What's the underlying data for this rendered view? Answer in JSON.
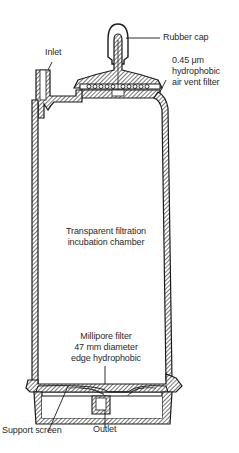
{
  "diagram": {
    "type": "cross-section",
    "line_color": "#1a1a1a",
    "background": "#ffffff",
    "labels": {
      "rubber_cap": "Rubber cap",
      "air_vent_filter": [
        "0.45 μm",
        "hydrophobic",
        "air vent filter"
      ],
      "inlet": "Inlet",
      "chamber": [
        "Transparent filtration",
        "incubation chamber"
      ],
      "millipore_filter": [
        "Millipore filter",
        "47 mm diameter",
        "edge hydrophobic"
      ],
      "support_screen": "Support screen",
      "outlet": "Outlet"
    }
  }
}
